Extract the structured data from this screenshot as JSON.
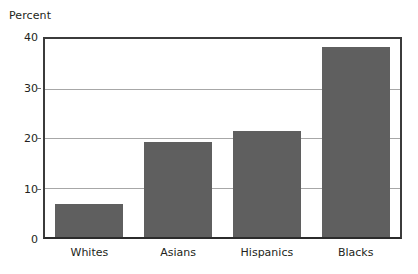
{
  "chart_data": {
    "type": "bar",
    "title": "",
    "subtitle": "",
    "xlabel": "",
    "ylabel": "Percent",
    "categories": [
      "Whites",
      "Asians",
      "Hispanics",
      "Blacks"
    ],
    "values": [
      6.7,
      19.0,
      21.3,
      38.0
    ],
    "series": [
      {
        "name": "Percent",
        "values": [
          6.7,
          19.0,
          21.3,
          38.0
        ]
      }
    ],
    "ylim": [
      0,
      40
    ],
    "yticks": [
      0,
      10,
      20,
      30,
      40
    ],
    "ytick_labels": [
      "0",
      "10",
      "20",
      "30",
      "40"
    ],
    "grid": true,
    "grid_axis": "y",
    "legend": false,
    "legend_position": "none",
    "bar_color": "#5f5f5f",
    "gridline_color": "#a7a7a7",
    "axis_color": "#3b3b3b",
    "background_color": "#ffffff",
    "text_color": "#231f20",
    "annotations": []
  },
  "caption": {
    "clipped_text": ""
  }
}
